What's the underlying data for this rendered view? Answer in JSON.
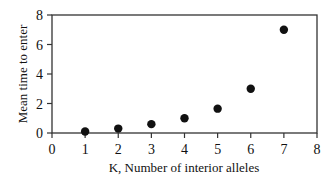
{
  "chart_data": {
    "type": "scatter",
    "title": "",
    "xlabel": "K, Number of interior alleles",
    "ylabel": "Mean time to enter",
    "xlim": [
      0,
      8
    ],
    "ylim": [
      0,
      8
    ],
    "xticks": [
      0,
      1,
      2,
      3,
      4,
      5,
      6,
      7,
      8
    ],
    "yticks": [
      0,
      2,
      4,
      6,
      8
    ],
    "grid": false,
    "legend": null,
    "series": [
      {
        "name": "Mean time to enter",
        "x": [
          1,
          2,
          3,
          4,
          5,
          6,
          7
        ],
        "y": [
          0.1,
          0.3,
          0.6,
          1.0,
          1.65,
          3.0,
          7.0
        ]
      }
    ],
    "colors": {
      "marker": "#111111",
      "axis": "#333333"
    }
  }
}
